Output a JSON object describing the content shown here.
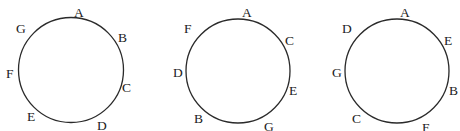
{
  "diagrams": [
    {
      "name": "circle-1",
      "points": [
        {
          "label": "A"
        },
        {
          "label": "B"
        },
        {
          "label": "C"
        },
        {
          "label": "D"
        },
        {
          "label": "E"
        },
        {
          "label": "F"
        },
        {
          "label": "G"
        }
      ]
    },
    {
      "name": "circle-2",
      "points": [
        {
          "label": "A"
        },
        {
          "label": "C"
        },
        {
          "label": "E"
        },
        {
          "label": "G"
        },
        {
          "label": "B"
        },
        {
          "label": "D"
        },
        {
          "label": "F"
        }
      ]
    },
    {
      "name": "circle-3",
      "points": [
        {
          "label": "A"
        },
        {
          "label": "E"
        },
        {
          "label": "B"
        },
        {
          "label": "F"
        },
        {
          "label": "C"
        },
        {
          "label": "G"
        },
        {
          "label": "D"
        }
      ]
    }
  ]
}
